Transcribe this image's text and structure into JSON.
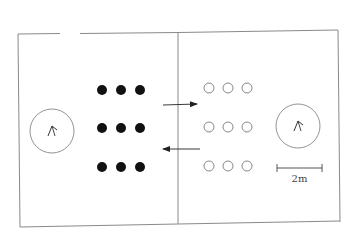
{
  "diagram": {
    "colors": {
      "frame": "#8a8a8a",
      "filled_dot": "#111111",
      "hollow_dot": "#7a7a7a",
      "arrow": "#222222",
      "circle": "#777777"
    },
    "left_zone": {
      "players": "filled",
      "rows": [
        [
          [
            102,
            90
          ],
          [
            121,
            90
          ],
          [
            140,
            90
          ]
        ],
        [
          [
            102,
            128
          ],
          [
            121,
            128
          ],
          [
            140,
            128
          ]
        ],
        [
          [
            102,
            167
          ],
          [
            121,
            167
          ],
          [
            140,
            167
          ]
        ]
      ],
      "marker_circle": {
        "cx": 52,
        "cy": 131,
        "r": 22,
        "icon": "chevron-up-icon"
      }
    },
    "right_zone": {
      "players": "hollow",
      "rows": [
        [
          [
            209,
            88
          ],
          [
            228,
            88
          ],
          [
            247,
            88
          ]
        ],
        [
          [
            209,
            127
          ],
          [
            228,
            127
          ],
          [
            247,
            127
          ]
        ],
        [
          [
            209,
            166
          ],
          [
            228,
            166
          ],
          [
            247,
            166
          ]
        ]
      ],
      "marker_circle": {
        "cx": 298,
        "cy": 126,
        "r": 22,
        "icon": "chevron-up-icon"
      }
    },
    "arrows": [
      {
        "direction": "right",
        "x1": 163,
        "y1": 105,
        "x2": 197,
        "y2": 104
      },
      {
        "direction": "left",
        "x1": 200,
        "y1": 149,
        "x2": 163,
        "y2": 149
      }
    ],
    "scale_bar": {
      "x1": 277,
      "x2": 322,
      "y": 168,
      "label": "2m"
    }
  }
}
